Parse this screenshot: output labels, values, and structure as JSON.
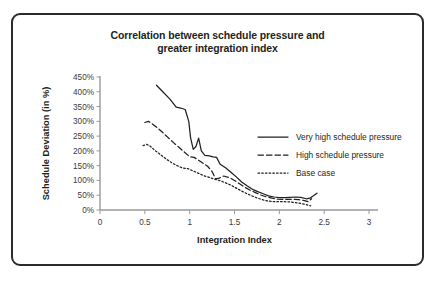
{
  "figure": {
    "title_line1": "Correlation between schedule pressure and",
    "title_line2": "greater integration index",
    "border_color": "#2b2b2b",
    "background": "#ffffff"
  },
  "chart_data": {
    "type": "line",
    "title": "Correlation between schedule pressure and greater integration index",
    "xlabel": "Integration Index",
    "ylabel": "Schedule Deviation (in %)",
    "xlim": [
      0,
      3
    ],
    "ylim": [
      0,
      450
    ],
    "xticks": [
      0,
      0.5,
      1,
      1.5,
      2,
      2.5,
      3
    ],
    "xtick_labels": [
      "0",
      "0.5",
      "1",
      "1.5",
      "2",
      "2.5",
      "3"
    ],
    "yticks": [
      0,
      50,
      100,
      150,
      200,
      250,
      300,
      350,
      400,
      450
    ],
    "ytick_labels": [
      "0%",
      "50%",
      "100%",
      "150%",
      "200%",
      "250%",
      "300%",
      "350%",
      "400%",
      "450%"
    ],
    "grid": false,
    "legend_position": "right",
    "series": [
      {
        "name": "Very high schedule pressure",
        "style": "solid",
        "color": "#231f20",
        "x": [
          0.63,
          0.7,
          0.78,
          0.85,
          0.9,
          0.95,
          0.99,
          1.01,
          1.04,
          1.07,
          1.1,
          1.13,
          1.17,
          1.22,
          1.26,
          1.3,
          1.34,
          1.4,
          1.46,
          1.52,
          1.58,
          1.64,
          1.7,
          1.76,
          1.82,
          1.88,
          1.94,
          2.0,
          2.06,
          2.12,
          2.18,
          2.24,
          2.3,
          2.34,
          2.38,
          2.42
        ],
        "y": [
          422,
          400,
          375,
          348,
          345,
          340,
          300,
          245,
          205,
          215,
          243,
          200,
          185,
          183,
          180,
          178,
          155,
          143,
          128,
          112,
          95,
          82,
          70,
          62,
          55,
          48,
          44,
          42,
          42,
          43,
          44,
          43,
          38,
          40,
          48,
          57
        ]
      },
      {
        "name": "High schedule pressure",
        "style": "dashed",
        "color": "#231f20",
        "x": [
          0.5,
          0.54,
          0.58,
          0.64,
          0.7,
          0.76,
          0.82,
          0.88,
          0.94,
          1.0,
          1.05,
          1.1,
          1.15,
          1.2,
          1.25,
          1.29,
          1.33,
          1.38,
          1.44,
          1.5,
          1.56,
          1.62,
          1.68,
          1.74,
          1.8,
          1.86,
          1.92,
          1.98,
          2.04,
          2.1,
          2.16,
          2.22,
          2.28,
          2.32,
          2.36
        ],
        "y": [
          296,
          300,
          292,
          278,
          262,
          245,
          228,
          212,
          196,
          180,
          178,
          168,
          158,
          148,
          130,
          105,
          108,
          115,
          110,
          100,
          88,
          76,
          66,
          58,
          50,
          44,
          40,
          37,
          36,
          36,
          36,
          35,
          32,
          28,
          38
        ]
      },
      {
        "name": "Base case",
        "style": "dotted",
        "color": "#231f20",
        "x": [
          0.48,
          0.52,
          0.56,
          0.62,
          0.68,
          0.74,
          0.8,
          0.86,
          0.92,
          0.98,
          1.04,
          1.1,
          1.16,
          1.22,
          1.28,
          1.34,
          1.4,
          1.46,
          1.52,
          1.58,
          1.64,
          1.7,
          1.76,
          1.82,
          1.88,
          1.94,
          2.0,
          2.06,
          2.12,
          2.18,
          2.24,
          2.3,
          2.35
        ],
        "y": [
          218,
          222,
          216,
          200,
          186,
          172,
          160,
          150,
          142,
          140,
          132,
          124,
          116,
          110,
          104,
          99,
          92,
          84,
          74,
          64,
          55,
          47,
          40,
          34,
          30,
          28,
          28,
          28,
          27,
          25,
          22,
          18,
          14
        ]
      }
    ]
  },
  "legend": {
    "items": [
      {
        "label": "Very high schedule pressure",
        "style": "solid"
      },
      {
        "label": "High schedule pressure",
        "style": "dashed"
      },
      {
        "label": "Base case",
        "style": "dotted"
      }
    ]
  }
}
